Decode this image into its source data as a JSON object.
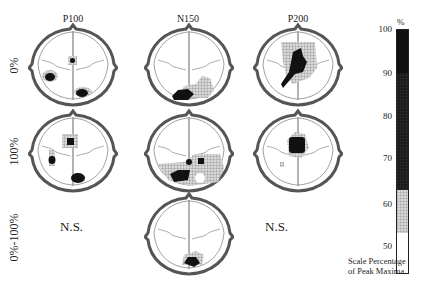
{
  "figure": {
    "columns": [
      {
        "label": "P100",
        "x": 70
      },
      {
        "label": "N150",
        "x": 188
      },
      {
        "label": "P200",
        "x": 297
      }
    ],
    "rows": [
      {
        "label": "0%",
        "y": 65
      },
      {
        "label": "100%",
        "y": 150
      },
      {
        "label": "0%-100%",
        "y": 236
      }
    ],
    "not_significant_label": "N.S.",
    "ns_cells": [
      {
        "column": "P100",
        "row": "0%-100%"
      },
      {
        "column": "P200",
        "row": "0%-100%"
      }
    ],
    "colorbar": {
      "unit": "%",
      "ticks": [
        "100",
        "90",
        "80",
        "70",
        "60",
        "50"
      ],
      "caption_line1": "Scale Percentage",
      "caption_line2": "of Peak Maxima",
      "bands": [
        {
          "range": "70-100",
          "fill": "dark"
        },
        {
          "range": "60-70",
          "fill": "hatched"
        },
        {
          "range": "50-60",
          "fill": "white"
        }
      ]
    }
  }
}
